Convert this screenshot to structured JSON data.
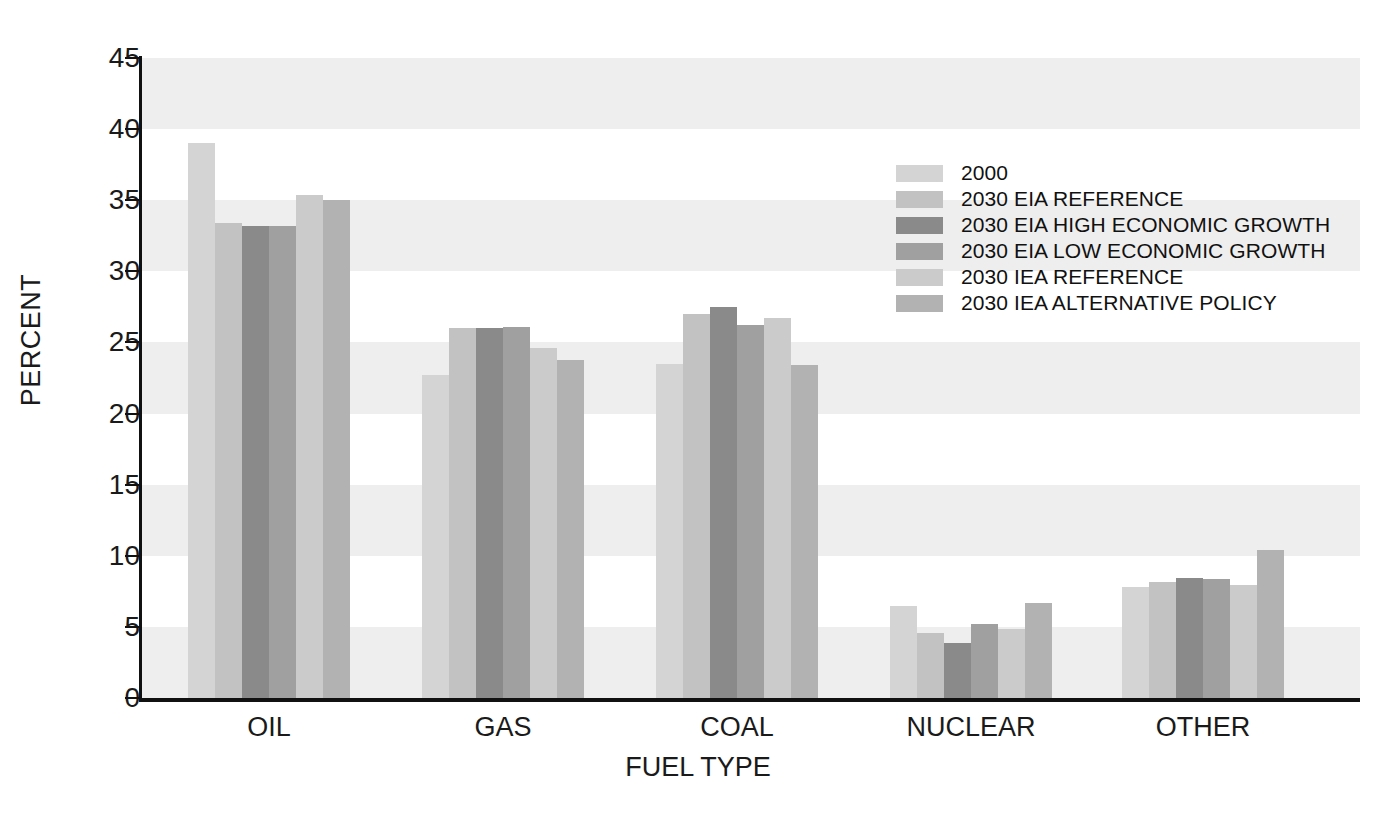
{
  "chart_data": {
    "type": "bar",
    "title": "",
    "xlabel": "FUEL TYPE",
    "ylabel": "PERCENT",
    "ylim": [
      0,
      45
    ],
    "yticks": [
      0,
      5,
      10,
      15,
      20,
      25,
      30,
      35,
      40,
      45
    ],
    "ytick_labels": [
      "0",
      "5",
      "10",
      "15",
      "20",
      "25",
      "30",
      "35",
      "40",
      "45"
    ],
    "grid": false,
    "banded_background": true,
    "legend_position": "upper right",
    "categories": [
      "OIL",
      "GAS",
      "COAL",
      "NUCLEAR",
      "OTHER"
    ],
    "series": [
      {
        "name": "2000",
        "color": "#d4d4d4",
        "values": [
          39.0,
          22.7,
          23.5,
          6.5,
          7.8
        ]
      },
      {
        "name": "2030 EIA REFERENCE",
        "color": "#c2c2c2",
        "values": [
          33.4,
          26.0,
          27.0,
          4.6,
          8.15
        ]
      },
      {
        "name": "2030 EIA HIGH ECONOMIC GROWTH",
        "color": "#8a8a8a",
        "values": [
          33.2,
          26.0,
          27.5,
          3.9,
          8.45
        ]
      },
      {
        "name": "2030 EIA LOW ECONOMIC GROWTH",
        "color": "#a0a0a0",
        "values": [
          33.2,
          26.1,
          26.2,
          5.2,
          8.4
        ]
      },
      {
        "name": "2030 IEA REFERENCE",
        "color": "#cbcbcb",
        "values": [
          35.4,
          24.6,
          26.7,
          4.85,
          7.95
        ]
      },
      {
        "name": "2030 IEA ALTERNATIVE POLICY",
        "color": "#b2b2b2",
        "values": [
          35.0,
          23.8,
          23.4,
          6.7,
          10.4
        ]
      }
    ]
  },
  "colors": {
    "axis": "#111111",
    "band": "#eeeeee",
    "background": "#ffffff",
    "text": "#1a1a1a"
  }
}
